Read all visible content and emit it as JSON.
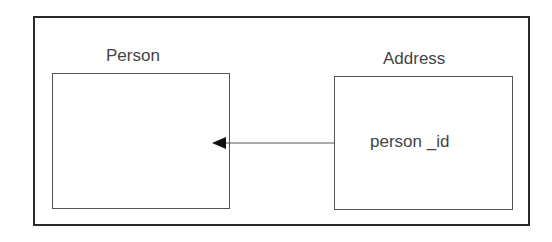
{
  "diagram": {
    "entities": [
      {
        "name": "Person",
        "fields": []
      },
      {
        "name": "Address",
        "fields": [
          "person _id"
        ]
      }
    ],
    "relationship": {
      "from": "Address.person _id",
      "to": "Person",
      "arrow": "filled-triangle"
    }
  }
}
